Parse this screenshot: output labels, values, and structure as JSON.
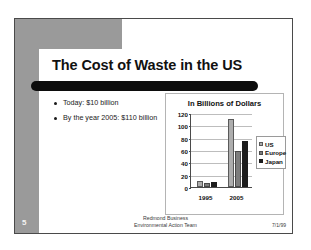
{
  "slide": {
    "title": "The Cost of Waste in the US",
    "number": "5",
    "bullets": [
      "Today: $10 billion",
      "By the year 2005: $110 billion"
    ],
    "footer": {
      "line1": "Redmond Business",
      "line2": "Environmental Action Team",
      "date": "7/1/99"
    },
    "redaction_bar": true,
    "colors": {
      "band": "#9a9a9a",
      "redaction": "#0c0c0c",
      "series_us": "#adadad",
      "series_europe": "#7d7d7d",
      "series_japan": "#1c1c1c"
    }
  },
  "chart_data": {
    "type": "bar",
    "title": "In Billions of Dollars",
    "xlabel": "",
    "ylabel": "",
    "categories": [
      "1995",
      "2005"
    ],
    "series": [
      {
        "name": "US",
        "values": [
          10,
          110
        ]
      },
      {
        "name": "Europe",
        "values": [
          6,
          58
        ]
      },
      {
        "name": "Japan",
        "values": [
          8,
          75
        ]
      }
    ],
    "ylim": [
      0,
      120
    ],
    "yticks": [
      0,
      20,
      40,
      60,
      80,
      100,
      120
    ],
    "grid": true,
    "legend_position": "right"
  }
}
